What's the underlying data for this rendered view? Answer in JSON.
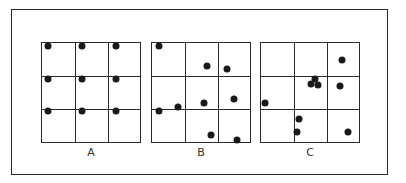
{
  "figure": {
    "panels": [
      {
        "label": "A",
        "pattern": "uniform",
        "left": 41,
        "dots": [
          [
            6,
            3
          ],
          [
            40,
            3
          ],
          [
            74,
            3
          ],
          [
            6,
            36
          ],
          [
            40,
            36
          ],
          [
            74,
            36
          ],
          [
            6,
            68
          ],
          [
            40,
            68
          ],
          [
            74,
            68
          ]
        ]
      },
      {
        "label": "B",
        "pattern": "random",
        "left": 151,
        "dots": [
          [
            7,
            3
          ],
          [
            55,
            23
          ],
          [
            75,
            26
          ],
          [
            26,
            64
          ],
          [
            52,
            60
          ],
          [
            82,
            56
          ],
          [
            7,
            68
          ],
          [
            59,
            92
          ],
          [
            85,
            97
          ]
        ]
      },
      {
        "label": "C",
        "pattern": "clustered",
        "left": 260,
        "dots": [
          [
            81,
            17
          ],
          [
            54,
            36
          ],
          [
            50,
            41
          ],
          [
            57,
            42
          ],
          [
            79,
            43
          ],
          [
            4,
            60
          ],
          [
            38,
            76
          ],
          [
            36,
            89
          ],
          [
            87,
            89
          ]
        ]
      }
    ]
  },
  "colors": {
    "line": "#2a2a2a",
    "dot": "#1a1a1a",
    "background": "#ffffff"
  }
}
